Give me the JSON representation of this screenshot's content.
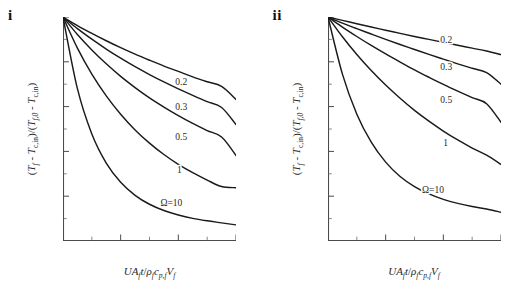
{
  "figure": {
    "panels": [
      {
        "label": "i",
        "name": "panel-i"
      },
      {
        "label": "ii",
        "name": "panel-ii"
      }
    ]
  },
  "axis_text": {
    "y_parts": {
      "open": "(",
      "T1": "T",
      "T1sub": "f",
      "minus1": " - ",
      "T2": "T",
      "T2sub": "c,in",
      "closeopen": ")/(",
      "T3": "T",
      "T3sub": "f,0",
      "minus2": " - ",
      "T4": "T",
      "T4sub": "c,in",
      "close": ")"
    },
    "x_parts": {
      "U": "U",
      "A": "A",
      "Asub": "f",
      "t": "t",
      "slash": "/",
      "rho": "ρ",
      "rhosub": "f",
      "c": "c",
      "csub": "p,f",
      "V": "V",
      "Vsub": "f"
    }
  },
  "chart_data": [
    {
      "type": "line",
      "panel": "i",
      "title": "i",
      "xlabel": "UA_f t / (rho_f c_p,f V_f)",
      "ylabel": "(T_f - T_c,in)/(T_f,0 - T_c,in)",
      "xlim": [
        0,
        3
      ],
      "ylim": [
        0,
        1
      ],
      "xticks": [
        "0",
        "1",
        "2",
        "3"
      ],
      "xtick_values": [
        0,
        1,
        2,
        3
      ],
      "yticks": [
        "0.0",
        "0.2",
        "0.4",
        "0.6",
        "0.8",
        "1.0"
      ],
      "ytick_values": [
        0.0,
        0.2,
        0.4,
        0.6,
        0.8,
        1.0
      ],
      "xminor_count": 1,
      "yminor_count": 1,
      "grid": false,
      "legend": "inline-curve-labels",
      "series": [
        {
          "name": "0.2",
          "label": "0.2",
          "label_x": 2.05,
          "label_y": 0.695,
          "x": [
            0,
            0.25,
            0.5,
            0.75,
            1.0,
            1.25,
            1.5,
            1.75,
            2.0,
            2.25,
            2.5,
            2.75,
            3.0
          ],
          "values": [
            1.0,
            0.962,
            0.927,
            0.894,
            0.863,
            0.834,
            0.807,
            0.781,
            0.757,
            0.733,
            0.711,
            0.69,
            0.632
          ]
        },
        {
          "name": "0.3",
          "label": "0.3",
          "label_x": 2.05,
          "label_y": 0.585,
          "x": [
            0,
            0.25,
            0.5,
            0.75,
            1.0,
            1.25,
            1.5,
            1.75,
            2.0,
            2.25,
            2.5,
            2.75,
            3.0
          ],
          "values": [
            1.0,
            0.948,
            0.901,
            0.857,
            0.816,
            0.778,
            0.743,
            0.71,
            0.679,
            0.65,
            0.622,
            0.596,
            0.52
          ]
        },
        {
          "name": "0.5",
          "label": "0.5",
          "label_x": 2.05,
          "label_y": 0.45,
          "x": [
            0,
            0.25,
            0.5,
            0.75,
            1.0,
            1.25,
            1.5,
            1.75,
            2.0,
            2.25,
            2.5,
            2.75,
            3.0
          ],
          "values": [
            1.0,
            0.922,
            0.853,
            0.791,
            0.735,
            0.685,
            0.639,
            0.598,
            0.56,
            0.525,
            0.493,
            0.464,
            0.382
          ]
        },
        {
          "name": "1",
          "label": "1",
          "label_x": 2.02,
          "label_y": 0.305,
          "x": [
            0,
            0.25,
            0.5,
            0.75,
            1.0,
            1.25,
            1.5,
            1.75,
            2.0,
            2.25,
            2.5,
            2.75,
            3.0
          ],
          "values": [
            1.0,
            0.861,
            0.745,
            0.648,
            0.566,
            0.496,
            0.437,
            0.386,
            0.342,
            0.305,
            0.272,
            0.243,
            0.238
          ]
        },
        {
          "name": "10",
          "label": "Ω=10",
          "label_x": 1.88,
          "label_y": 0.155,
          "x": [
            0,
            0.25,
            0.5,
            0.75,
            1.0,
            1.25,
            1.5,
            1.75,
            2.0,
            2.25,
            2.5,
            2.75,
            3.0
          ],
          "values": [
            1.0,
            0.68,
            0.478,
            0.348,
            0.262,
            0.204,
            0.164,
            0.136,
            0.116,
            0.101,
            0.09,
            0.081,
            0.072
          ]
        }
      ]
    },
    {
      "type": "line",
      "panel": "ii",
      "title": "ii",
      "xlabel": "UA_f t / (rho_f c_p,f V_f)",
      "ylabel": "(T_f - T_c,in)/(T_f,0 - T_c,in)",
      "xlim": [
        0,
        3
      ],
      "ylim": [
        0,
        1
      ],
      "xticks": [
        "0",
        "1",
        "2",
        "3"
      ],
      "xtick_values": [
        0,
        1,
        2,
        3
      ],
      "yticks": [
        "0.0",
        "0.2",
        "0.4",
        "0.6",
        "0.8",
        "1.0"
      ],
      "ytick_values": [
        0.0,
        0.2,
        0.4,
        0.6,
        0.8,
        1.0
      ],
      "xminor_count": 1,
      "yminor_count": 1,
      "grid": false,
      "legend": "inline-curve-labels",
      "series": [
        {
          "name": "0.2",
          "label": "0.2",
          "label_x": 2.05,
          "label_y": 0.885,
          "x": [
            0,
            0.25,
            0.5,
            0.75,
            1.0,
            1.25,
            1.5,
            1.75,
            2.0,
            2.25,
            2.5,
            2.75,
            3.0
          ],
          "values": [
            1.0,
            0.985,
            0.97,
            0.955,
            0.941,
            0.927,
            0.913,
            0.9,
            0.887,
            0.874,
            0.861,
            0.848,
            0.832
          ]
        },
        {
          "name": "0.3",
          "label": "0.3",
          "label_x": 2.05,
          "label_y": 0.765,
          "x": [
            0,
            0.25,
            0.5,
            0.75,
            1.0,
            1.25,
            1.5,
            1.75,
            2.0,
            2.25,
            2.5,
            2.75,
            3.0
          ],
          "values": [
            1.0,
            0.973,
            0.948,
            0.924,
            0.9,
            0.877,
            0.855,
            0.833,
            0.812,
            0.791,
            0.771,
            0.752,
            0.7
          ]
        },
        {
          "name": "0.5",
          "label": "0.5",
          "label_x": 2.05,
          "label_y": 0.615,
          "x": [
            0,
            0.25,
            0.5,
            0.75,
            1.0,
            1.25,
            1.5,
            1.75,
            2.0,
            2.25,
            2.5,
            2.75,
            3.0
          ],
          "values": [
            1.0,
            0.955,
            0.913,
            0.873,
            0.835,
            0.799,
            0.764,
            0.731,
            0.699,
            0.669,
            0.64,
            0.613,
            0.53
          ]
        },
        {
          "name": "1",
          "label": "1",
          "label_x": 2.04,
          "label_y": 0.425,
          "x": [
            0,
            0.25,
            0.5,
            0.75,
            1.0,
            1.25,
            1.5,
            1.75,
            2.0,
            2.25,
            2.5,
            2.75,
            3.0
          ],
          "values": [
            1.0,
            0.912,
            0.833,
            0.761,
            0.696,
            0.637,
            0.583,
            0.535,
            0.491,
            0.451,
            0.415,
            0.383,
            0.342
          ]
        },
        {
          "name": "10",
          "label": "Ω=10",
          "label_x": 1.82,
          "label_y": 0.215,
          "x": [
            0,
            0.25,
            0.5,
            0.75,
            1.0,
            1.25,
            1.5,
            1.75,
            2.0,
            2.25,
            2.5,
            2.75,
            3.0
          ],
          "values": [
            1.0,
            0.745,
            0.566,
            0.441,
            0.352,
            0.288,
            0.243,
            0.21,
            0.186,
            0.168,
            0.154,
            0.143,
            0.128
          ]
        }
      ]
    }
  ]
}
